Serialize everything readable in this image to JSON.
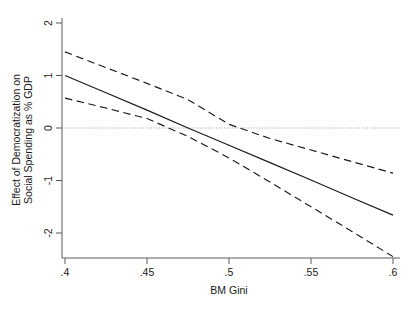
{
  "chart_data": {
    "type": "line",
    "title": "",
    "subtitle": "",
    "xlabel": "BM Gini",
    "ylabel": "Effect of Democratization on Social Spending as % GDP",
    "ylabel_line1": "Effect of Democratization on",
    "ylabel_line2": "Social Spending as % GDP",
    "xlim": [
      0.4,
      0.6
    ],
    "ylim": [
      -2.55,
      2.15
    ],
    "xticks": [
      0.4,
      0.45,
      0.5,
      0.55,
      0.6
    ],
    "xtick_labels": [
      ".4",
      ".45",
      ".5",
      ".55",
      ".6"
    ],
    "yticks": [
      -2,
      -1,
      0,
      1,
      2
    ],
    "ytick_labels": [
      "-2",
      "-1",
      "0",
      "1",
      "2"
    ],
    "grid": false,
    "legend": "none",
    "reference_lines": [
      {
        "name": "zero-line",
        "axis": "y",
        "value": 0,
        "style": "dotted",
        "color": "#9a9a9a"
      }
    ],
    "x": [
      0.4,
      0.425,
      0.45,
      0.475,
      0.5,
      0.525,
      0.55,
      0.575,
      0.6
    ],
    "series": [
      {
        "name": "Marginal effect",
        "style": "solid",
        "color": "#1a1a1a",
        "values": [
          1.0,
          0.67,
          0.34,
          0.0,
          -0.33,
          -0.66,
          -0.99,
          -1.33,
          -1.66
        ]
      },
      {
        "name": "Upper 95% confidence bound",
        "style": "dashed",
        "color": "#1a1a1a",
        "values": [
          1.45,
          1.15,
          0.85,
          0.54,
          0.07,
          -0.2,
          -0.42,
          -0.64,
          -0.86
        ]
      },
      {
        "name": "Lower 95% confidence bound",
        "style": "dashed",
        "color": "#1a1a1a",
        "values": [
          0.57,
          0.38,
          0.18,
          -0.16,
          -0.57,
          -1.03,
          -1.5,
          -1.97,
          -2.45
        ]
      }
    ],
    "annotations": []
  }
}
